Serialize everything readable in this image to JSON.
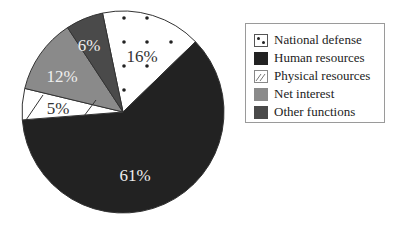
{
  "chart_data": {
    "type": "pie",
    "title": "",
    "categories": [
      "National defense",
      "Human resources",
      "Physical resources",
      "Net interest",
      "Other functions"
    ],
    "values": [
      16,
      61,
      5,
      12,
      6
    ],
    "value_labels": [
      "16%",
      "61%",
      "5%",
      "12%",
      "6%"
    ],
    "unit": "%",
    "start_angle_deg_clockwise_from_top": -11.7,
    "direction": "clockwise",
    "legend_position": "right",
    "fills": {
      "National defense": {
        "pattern": "dots",
        "background": "#ffffff",
        "color": "#222222"
      },
      "Human resources": {
        "pattern": "solid",
        "color": "#222222"
      },
      "Physical resources": {
        "pattern": "diagonal-hatch",
        "background": "#ffffff",
        "color": "#333333"
      },
      "Net interest": {
        "pattern": "solid",
        "color": "#8a8a8a"
      },
      "Other functions": {
        "pattern": "solid",
        "color": "#4a4a4a"
      }
    }
  },
  "legend": {
    "items": [
      {
        "label": "National defense",
        "key": "dots"
      },
      {
        "label": "Human resources",
        "key": "dark"
      },
      {
        "label": "Physical resources",
        "key": "hatch"
      },
      {
        "label": "Net interest",
        "key": "mid"
      },
      {
        "label": "Other functions",
        "key": "darkgray"
      }
    ]
  },
  "labels": {
    "national_defense": "16%",
    "human_resources": "61%",
    "physical_resources": "5%",
    "net_interest": "12%",
    "other_functions": "6%"
  },
  "colors": {
    "dark": "#222222",
    "mid": "#8a8a8a",
    "darkgray": "#4a4a4a",
    "outline": "#333333",
    "label_light": "#eeeeee",
    "label_dark": "#333333"
  }
}
